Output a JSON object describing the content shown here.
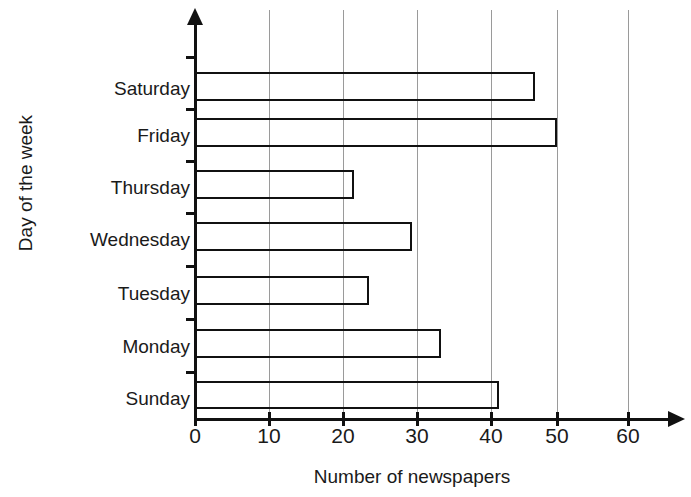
{
  "chart_data": {
    "type": "bar",
    "orientation": "horizontal",
    "title": "",
    "xlabel": "Number of newspapers",
    "ylabel": "Day of the week",
    "categories": [
      "Sunday",
      "Monday",
      "Tuesday",
      "Wednesday",
      "Thursday",
      "Friday",
      "Saturday"
    ],
    "values": [
      42,
      34,
      24,
      30,
      22,
      50,
      47
    ],
    "xlim": [
      0,
      65
    ],
    "xticks": [
      0,
      10,
      20,
      30,
      40,
      50,
      60
    ],
    "xtick_labels": [
      "0",
      "10",
      "20",
      "30",
      "40",
      "50",
      "60"
    ],
    "grid": "vertical",
    "legend": "none",
    "bar_style": {
      "fill": "none",
      "outline_color": "#111111"
    },
    "axis_color": "#111111",
    "gridline_color": "#9a9a9a",
    "background": "#ffffff"
  }
}
